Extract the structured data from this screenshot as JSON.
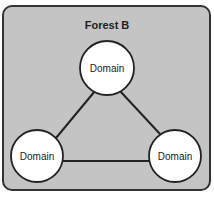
{
  "forest": {
    "title": "Forest B",
    "fill": "#c4c4c4",
    "border": "#333333"
  },
  "domains": [
    {
      "label": "Domain",
      "position": "top"
    },
    {
      "label": "Domain",
      "position": "bottom-left"
    },
    {
      "label": "Domain",
      "position": "bottom-right"
    }
  ],
  "links": [
    {
      "from": 0,
      "to": 1
    },
    {
      "from": 0,
      "to": 2
    },
    {
      "from": 1,
      "to": 2
    }
  ]
}
